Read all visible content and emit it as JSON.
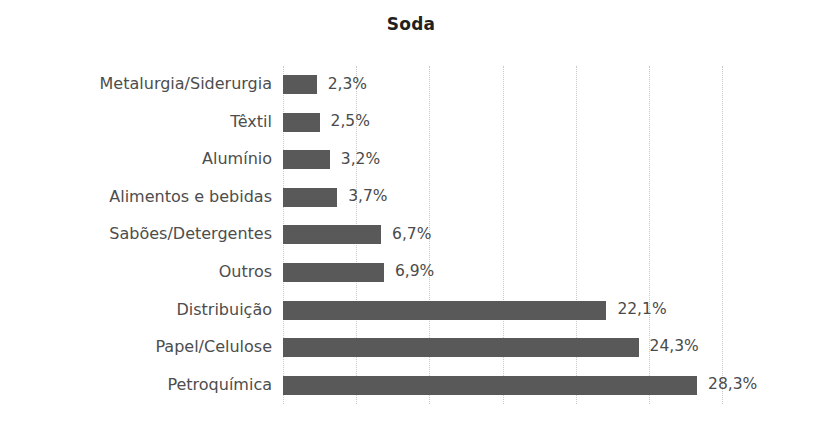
{
  "chart_data": {
    "type": "bar",
    "orientation": "horizontal",
    "title": "Soda",
    "xlabel": "",
    "ylabel": "",
    "categories": [
      "Metalurgia/Siderurgia",
      "Têxtil",
      "Alumínio",
      "Alimentos e bebidas",
      "Sabões/Detergentes",
      "Outros",
      "Distribuição",
      "Papel/Celulose",
      "Petroquímica"
    ],
    "values": [
      2.3,
      2.5,
      3.2,
      3.7,
      6.7,
      6.9,
      22.1,
      24.3,
      28.3
    ],
    "value_labels": [
      "2,3%",
      "2,5%",
      "3,2%",
      "3,7%",
      "6,7%",
      "6,9%",
      "22,1%",
      "24,3%",
      "28,3%"
    ],
    "unit": "%",
    "xlim": [
      0,
      30
    ],
    "xticks": [
      0,
      5,
      10,
      15,
      20,
      25,
      30
    ],
    "xtick_labels": [],
    "grid": true,
    "grid_orientation": "vertical",
    "grid_style": "dotted",
    "legend": false,
    "bar_color": "#595959",
    "grid_color": "#c9c9cc",
    "label_color": "#4d4d4d",
    "value_color": "#4a4a4a",
    "title_color": "#231f20",
    "background": "#ffffff"
  }
}
